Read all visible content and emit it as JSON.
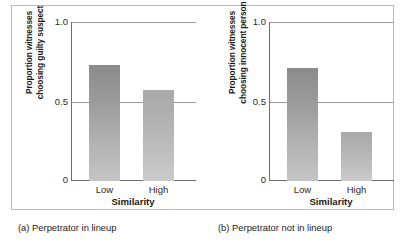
{
  "figure": {
    "panels": [
      {
        "caption": "(a) Perpetrator in lineup",
        "ylabel": "Proportion witnesses\nchoosing guilty suspect",
        "xlabel": "Similarity",
        "yticks": [
          "1.0",
          "0.5",
          "0"
        ],
        "xticks": [
          "Low",
          "High"
        ]
      },
      {
        "caption": "(b) Perpetrator not in lineup",
        "ylabel": "Proportion witnesses\nchoosing innocent person",
        "xlabel": "Similarity",
        "yticks": [
          "1.0",
          "0.5",
          "0"
        ],
        "xticks": [
          "Low",
          "High"
        ]
      }
    ]
  },
  "colors": {
    "bar_dark_top": "#8b8b8b",
    "bar_dark_bottom": "#c4c4c4",
    "bar_light_top": "#a8a8a8",
    "bar_light_bottom": "#cbcbcb",
    "gridline": "#9a9a9a",
    "axis": "#6e6e6e",
    "frame": "#b9b9b9",
    "background": "#ffffff"
  },
  "chart_data": [
    {
      "type": "bar",
      "title": "(a) Perpetrator in lineup",
      "categories": [
        "Low",
        "High"
      ],
      "values": [
        0.73,
        0.57
      ],
      "xlabel": "Similarity",
      "ylabel": "Proportion witnesses choosing guilty suspect",
      "ylim": [
        0,
        1.0
      ],
      "yticks": [
        0,
        0.5,
        1.0
      ],
      "ytick_labels": [
        "0",
        "0.5",
        "1.0"
      ],
      "grid": true,
      "legend": "none"
    },
    {
      "type": "bar",
      "title": "(b) Perpetrator not in lineup",
      "categories": [
        "Low",
        "High"
      ],
      "values": [
        0.71,
        0.31
      ],
      "xlabel": "Similarity",
      "ylabel": "Proportion witnesses choosing innocent person",
      "ylim": [
        0,
        1.0
      ],
      "yticks": [
        0,
        0.5,
        1.0
      ],
      "ytick_labels": [
        "0",
        "0.5",
        "1.0"
      ],
      "grid": true,
      "legend": "none"
    }
  ]
}
